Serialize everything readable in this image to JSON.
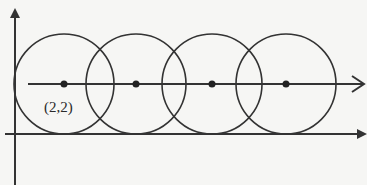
{
  "diagram": {
    "colors": {
      "stroke": "#333333",
      "background": "#f6f6f4"
    },
    "axes": {
      "x_axis": {
        "y": 134,
        "x_start": 5,
        "x_end": 367
      },
      "y_axis": {
        "x": 15,
        "y_start": 185,
        "y_end": 8
      }
    },
    "center_line": {
      "y": 84,
      "x_start": 28,
      "x_end": 364,
      "arrow": "open"
    },
    "circles": [
      {
        "cx": 64,
        "cy": 84,
        "r": 50
      },
      {
        "cx": 136,
        "cy": 84,
        "r": 50
      },
      {
        "cx": 212,
        "cy": 84,
        "r": 50
      },
      {
        "cx": 286,
        "cy": 84,
        "r": 50
      }
    ],
    "labels": {
      "first_center": "(2,2)"
    }
  }
}
